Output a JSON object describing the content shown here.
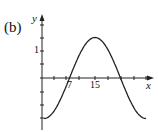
{
  "panel_label": "(b)",
  "chart_data": {
    "type": "line",
    "title": "",
    "xlabel": "x",
    "ylabel": "y",
    "x_tick_labels": [
      "7",
      "15"
    ],
    "y_tick_labels": [
      "1"
    ],
    "series": [
      {
        "name": "curve",
        "x": [
          0,
          3,
          5,
          7,
          9,
          11,
          13,
          15,
          17,
          19,
          21,
          23,
          25,
          27,
          30
        ],
        "y": [
          -1.5,
          -1.3,
          -0.75,
          -0.1,
          0.45,
          1.0,
          1.4,
          1.5,
          1.4,
          1.0,
          0.45,
          -0.1,
          -0.75,
          -1.3,
          -1.5
        ]
      }
    ],
    "xlim": [
      0,
      31
    ],
    "ylim": [
      -1.9,
      2.0
    ],
    "grid": false,
    "legend": "none"
  }
}
